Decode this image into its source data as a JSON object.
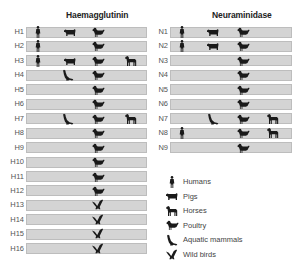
{
  "panels": {
    "haemagglutinin": {
      "title": "Haemagglutinin",
      "rows": [
        {
          "label": "H1",
          "hosts": [
            "human",
            "pig",
            "poultry"
          ]
        },
        {
          "label": "H2",
          "hosts": [
            "human",
            "poultry"
          ]
        },
        {
          "label": "H3",
          "hosts": [
            "human",
            "pig",
            "poultry",
            "horse"
          ]
        },
        {
          "label": "H4",
          "hosts": [
            "aquatic",
            "poultry"
          ]
        },
        {
          "label": "H5",
          "hosts": [
            "poultry"
          ]
        },
        {
          "label": "H6",
          "hosts": [
            "poultry"
          ]
        },
        {
          "label": "H7",
          "hosts": [
            "aquatic",
            "poultry",
            "horse"
          ]
        },
        {
          "label": "H8",
          "hosts": [
            "poultry"
          ]
        },
        {
          "label": "H9",
          "hosts": [
            "poultry"
          ]
        },
        {
          "label": "H10",
          "hosts": [
            "poultry"
          ]
        },
        {
          "label": "H11",
          "hosts": [
            "poultry"
          ]
        },
        {
          "label": "H12",
          "hosts": [
            "poultry"
          ]
        },
        {
          "label": "H13",
          "hosts": [
            "wildbird"
          ]
        },
        {
          "label": "H14",
          "hosts": [
            "wildbird"
          ]
        },
        {
          "label": "H15",
          "hosts": [
            "wildbird"
          ]
        },
        {
          "label": "H16",
          "hosts": [
            "wildbird"
          ]
        }
      ]
    },
    "neuraminidase": {
      "title": "Neuraminidase",
      "rows": [
        {
          "label": "N1",
          "hosts": [
            "human",
            "pig",
            "poultry"
          ]
        },
        {
          "label": "N2",
          "hosts": [
            "human",
            "pig",
            "poultry"
          ]
        },
        {
          "label": "N3",
          "hosts": [
            "poultry"
          ]
        },
        {
          "label": "N4",
          "hosts": [
            "poultry"
          ]
        },
        {
          "label": "N5",
          "hosts": [
            "poultry"
          ]
        },
        {
          "label": "N6",
          "hosts": [
            "poultry"
          ]
        },
        {
          "label": "N7",
          "hosts": [
            "aquatic",
            "poultry",
            "horse"
          ]
        },
        {
          "label": "N8",
          "hosts": [
            "human",
            "poultry",
            "horse"
          ]
        },
        {
          "label": "N9",
          "hosts": [
            "poultry"
          ]
        }
      ]
    }
  },
  "legend": [
    {
      "key": "human",
      "label": "Humans"
    },
    {
      "key": "pig",
      "label": "Pigs"
    },
    {
      "key": "horse",
      "label": "Horses"
    },
    {
      "key": "poultry",
      "label": "Poultry"
    },
    {
      "key": "aquatic",
      "label": "Aquatic mammals"
    },
    {
      "key": "wildbird",
      "label": "Wild birds"
    }
  ],
  "colors": {
    "bar": "#d4d4d4",
    "bar_border": "#bdbdbd",
    "icon": "#1a1a1a"
  }
}
